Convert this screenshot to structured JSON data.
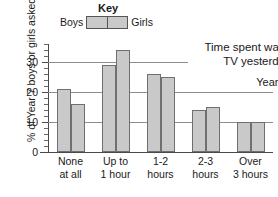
{
  "key": {
    "title": "Key",
    "left_label": "Boys",
    "right_label": "Girls"
  },
  "chart_data": {
    "type": "bar",
    "title": "Time spent watching TV yesterday",
    "title_line1": "Time spent watching",
    "title_line2": "TV yesterday",
    "annotation": "Year 7",
    "xlabel": "",
    "ylabel": "% of Year 7 boys or girls asked",
    "ylim": [
      0,
      36
    ],
    "yticks": [
      0,
      10,
      20,
      30
    ],
    "ytick_labels": [
      "0",
      "10",
      "20",
      "30"
    ],
    "minor_tick_step": 2,
    "grid": true,
    "grid_axis": "y",
    "legend_position": "top",
    "categories": [
      "None at all",
      "Up to 1 hour",
      "1-2 hours",
      "2-3 hours",
      "Over 3 hours"
    ],
    "category_lines": [
      {
        "l1": "None",
        "l2": "at all"
      },
      {
        "l1": "Up to",
        "l2": "1 hour"
      },
      {
        "l1": "1-2",
        "l2": "hours"
      },
      {
        "l1": "2-3",
        "l2": "hours"
      },
      {
        "l1": "Over",
        "l2": "3 hours"
      }
    ],
    "series": [
      {
        "name": "Boys",
        "values": [
          21,
          29,
          26,
          14,
          10
        ]
      },
      {
        "name": "Girls",
        "values": [
          16,
          34,
          25,
          15,
          10
        ]
      }
    ],
    "bar_color": "#c9c9c9",
    "bar_border_color": "#6f6f6f",
    "axis_color": "#4a4a4a",
    "grid_color": "#8d8d8d"
  }
}
